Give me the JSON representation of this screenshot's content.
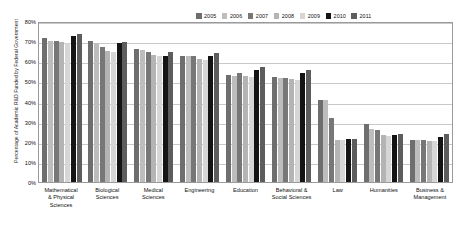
{
  "chart_data": {
    "type": "bar",
    "title": "",
    "xlabel": "",
    "ylabel": "Percentage of Academic R&D Funded by Federal Government",
    "ylim": [
      0,
      80
    ],
    "ytick_labels": [
      "0%",
      "10%",
      "20%",
      "30%",
      "40%",
      "50%",
      "60%",
      "70%",
      "80%"
    ],
    "ytick_values": [
      0,
      10,
      20,
      30,
      40,
      50,
      60,
      70,
      80
    ],
    "grid": true,
    "legend_position": "top-right",
    "categories": [
      "Mathematical & Physical Sciences",
      "Biological Sciences",
      "Medical Sciences",
      "Engineering",
      "Education",
      "Behavioral & Social Sciences",
      "Law",
      "Humanities",
      "Business & Management"
    ],
    "category_lines": [
      [
        "Mathematical",
        "& Physical",
        "Sciences"
      ],
      [
        "Biological",
        "Sciences"
      ],
      [
        "Medical",
        "Sciences"
      ],
      [
        "Engineering"
      ],
      [
        "Education"
      ],
      [
        "Behavioral &",
        "Social Sciences"
      ],
      [
        "Law"
      ],
      [
        "Humanities"
      ],
      [
        "Business &",
        "Management"
      ]
    ],
    "series": [
      {
        "name": "2005",
        "color": "#6e6e6e",
        "values": [
          71.5,
          70.0,
          66.0,
          62.5,
          53.0,
          52.0,
          41.0,
          29.0,
          21.0
        ]
      },
      {
        "name": "2006",
        "color": "#bdbdbd",
        "values": [
          70.0,
          69.0,
          65.5,
          62.5,
          52.5,
          51.5,
          41.0,
          26.5,
          21.0
        ]
      },
      {
        "name": "2007",
        "color": "#777777",
        "values": [
          70.0,
          67.0,
          64.5,
          62.5,
          54.0,
          51.5,
          32.0,
          26.0,
          21.0
        ]
      },
      {
        "name": "2008",
        "color": "#b4b4b4",
        "values": [
          69.5,
          65.0,
          63.0,
          61.0,
          52.5,
          51.0,
          21.0,
          23.5,
          20.5
        ]
      },
      {
        "name": "2009",
        "color": "#d6d6d6",
        "values": [
          69.0,
          64.5,
          62.5,
          60.5,
          52.0,
          50.5,
          21.0,
          23.0,
          20.5
        ]
      },
      {
        "name": "2010",
        "color": "#141414",
        "values": [
          72.5,
          69.0,
          62.5,
          62.5,
          55.5,
          54.0,
          21.5,
          23.5,
          22.5
        ]
      },
      {
        "name": "2011",
        "color": "#5d5d5d",
        "values": [
          73.5,
          69.5,
          64.5,
          64.0,
          57.0,
          55.5,
          21.5,
          24.0,
          24.0
        ]
      }
    ]
  },
  "legend": {
    "items": [
      {
        "label": "2005",
        "color": "#6e6e6e"
      },
      {
        "label": "2006",
        "color": "#bdbdbd"
      },
      {
        "label": "2007",
        "color": "#777777"
      },
      {
        "label": "2008",
        "color": "#b4b4b4"
      },
      {
        "label": "2009",
        "color": "#d6d6d6"
      },
      {
        "label": "2010",
        "color": "#141414"
      },
      {
        "label": "2011",
        "color": "#5d5d5d"
      }
    ]
  }
}
